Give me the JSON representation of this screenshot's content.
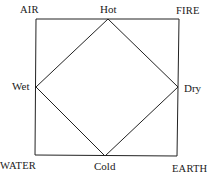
{
  "diagram": {
    "corners": {
      "top_left": "AIR",
      "top_right": "FIRE",
      "bottom_left": "WATER",
      "bottom_right": "EARTH"
    },
    "diamond_vertices": {
      "top": "Hot",
      "left": "Wet",
      "right": "Dry",
      "bottom": "Cold"
    },
    "line_color": "#222222"
  }
}
